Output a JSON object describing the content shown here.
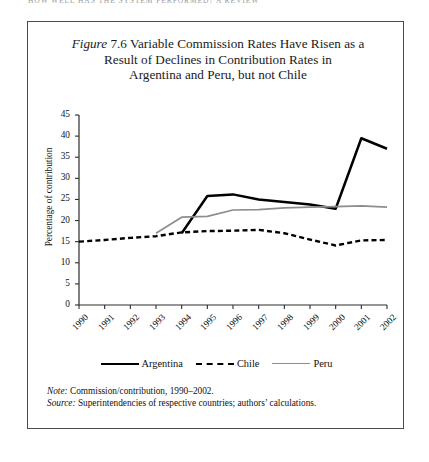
{
  "running_header": {
    "text": "HOW WELL HAS THE  SYSTEM  PERFORMED? A REVIEW"
  },
  "figure": {
    "label": "Figure",
    "number": "7.6",
    "title_line1": "Variable Commission Rates Have Risen as a",
    "title_line2": "Result of Declines in Contribution Rates in",
    "title_line3": "Argentina and Peru, but not Chile"
  },
  "notes": {
    "note_lead": "Note:",
    "note_text": "Commission/contribution, 1990–2002.",
    "source_lead": "Source:",
    "source_text": "Superintendencies of respective countries; authors’ calculations."
  },
  "legend": {
    "items": [
      {
        "name": "Argentina",
        "style": "solid",
        "color": "#000000"
      },
      {
        "name": "Chile",
        "style": "dashed",
        "color": "#000000"
      },
      {
        "name": "Peru",
        "style": "solid",
        "color": "#8d8d8d"
      }
    ]
  },
  "chart_data": {
    "type": "line",
    "title": "Variable Commission Rates Have Risen as a Result of Declines in Contribution Rates in Argentina and Peru, but not Chile",
    "xlabel": "",
    "ylabel": "Percentage of contribution",
    "x": [
      "1990",
      "1991",
      "1992",
      "1993",
      "1994",
      "1995",
      "1996",
      "1997",
      "1998",
      "1999",
      "2000",
      "2001",
      "2002"
    ],
    "categories": [
      "1990",
      "1991",
      "1992",
      "1993",
      "1994",
      "1995",
      "1996",
      "1997",
      "1998",
      "1999",
      "2000",
      "2001",
      "2002"
    ],
    "ylim": [
      0,
      45
    ],
    "yticks": [
      0,
      5,
      10,
      15,
      20,
      25,
      30,
      35,
      40,
      45
    ],
    "ytick_labels": [
      "0",
      "5",
      "10",
      "15",
      "20",
      "25",
      "30",
      "35",
      "40",
      "45"
    ],
    "grid": false,
    "legend_position": "bottom",
    "series": [
      {
        "name": "Argentina",
        "color": "#000000",
        "style": "solid",
        "values": [
          null,
          null,
          null,
          null,
          17.0,
          25.8,
          26.2,
          25.0,
          24.4,
          23.8,
          22.8,
          39.5,
          37.0
        ]
      },
      {
        "name": "Chile",
        "color": "#000000",
        "style": "dashed",
        "values": [
          15.0,
          15.4,
          15.9,
          16.3,
          17.2,
          17.5,
          17.6,
          17.8,
          17.0,
          15.5,
          14.1,
          15.3,
          15.4
        ]
      },
      {
        "name": "Peru",
        "color": "#8d8d8d",
        "style": "solid",
        "values": [
          null,
          null,
          null,
          17.0,
          20.8,
          21.0,
          22.5,
          22.6,
          23.0,
          23.2,
          23.3,
          23.5,
          23.2
        ]
      }
    ]
  }
}
